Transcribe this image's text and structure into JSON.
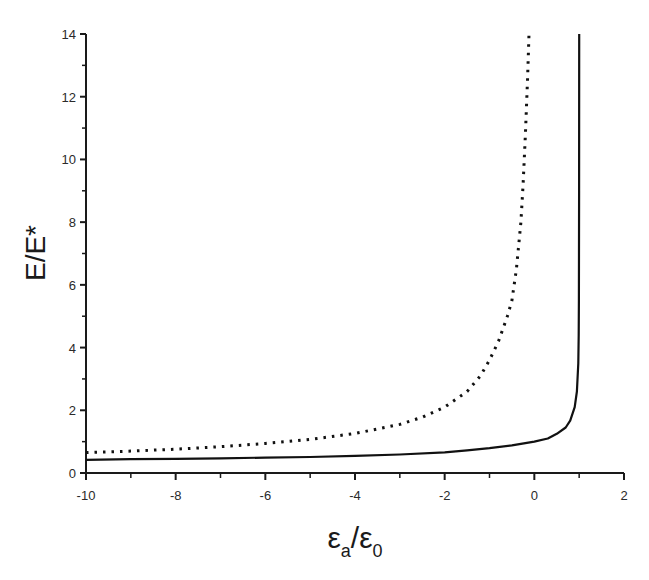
{
  "chart_data": {
    "type": "line",
    "title": "",
    "xlabel": "εa/ε0",
    "xlabel_parts": {
      "base1": "ε",
      "sub1": "a",
      "slash": "/",
      "base2": "ε",
      "sub2": "0"
    },
    "ylabel": "E/E*",
    "xlim": [
      -10,
      2
    ],
    "ylim": [
      0,
      14
    ],
    "x_ticks": [
      -10,
      -8,
      -6,
      -4,
      -2,
      0,
      2
    ],
    "x_tick_labels": [
      "-10",
      "-8",
      "-6",
      "-4",
      "-2",
      "0",
      "2"
    ],
    "x_minor_ticks": [
      -9,
      -7,
      -5,
      -3,
      -1,
      1
    ],
    "y_ticks": [
      0,
      2,
      4,
      6,
      8,
      10,
      12,
      14
    ],
    "y_tick_labels": [
      "0",
      "2",
      "4",
      "6",
      "8",
      "10",
      "12",
      "14"
    ],
    "y_minor_ticks": [
      1,
      3,
      5,
      7,
      9,
      11,
      13
    ],
    "grid": false,
    "legend": null,
    "series": [
      {
        "name": "solid",
        "style": "solid",
        "color": "#111111",
        "x": [
          -10,
          -9,
          -8,
          -7,
          -6,
          -5,
          -4,
          -3,
          -2,
          -1.5,
          -1,
          -0.5,
          0,
          0.3,
          0.5,
          0.7,
          0.8,
          0.9,
          0.95,
          0.98,
          0.99,
          0.995,
          0.999,
          1.0
        ],
        "y": [
          0.42,
          0.44,
          0.45,
          0.47,
          0.49,
          0.51,
          0.55,
          0.59,
          0.66,
          0.72,
          0.79,
          0.88,
          1.0,
          1.1,
          1.25,
          1.45,
          1.67,
          2.1,
          2.6,
          3.5,
          4.4,
          5.5,
          9.0,
          14.0
        ]
      },
      {
        "name": "dotted",
        "style": "dotted",
        "color": "#111111",
        "x": [
          -10,
          -9,
          -8,
          -7,
          -6,
          -5,
          -4,
          -3,
          -2.5,
          -2,
          -1.5,
          -1.2,
          -1,
          -0.8,
          -0.6,
          -0.5,
          -0.4,
          -0.3,
          -0.25,
          -0.2,
          -0.15,
          -0.12
        ],
        "y": [
          0.65,
          0.7,
          0.76,
          0.84,
          0.94,
          1.07,
          1.26,
          1.55,
          1.78,
          2.1,
          2.6,
          3.1,
          3.6,
          4.2,
          5.0,
          5.5,
          6.5,
          8.0,
          9.2,
          10.8,
          12.6,
          14.0
        ]
      }
    ]
  },
  "plot_area": {
    "left": 86,
    "top": 34,
    "right": 624,
    "bottom": 473
  }
}
